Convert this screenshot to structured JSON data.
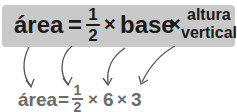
{
  "formula": {
    "area": "área",
    "equals": "=",
    "half_num": "1",
    "half_den": "2",
    "times": "×",
    "base": "base",
    "height_line1": "altura",
    "height_line2": "vertical"
  },
  "substituted": {
    "area": "área",
    "equals": "=",
    "half_num": "1",
    "half_den": "2",
    "times1": "×",
    "base_value": "6",
    "times2": "×",
    "height_value": "3"
  },
  "colors": {
    "box_bg": "#c9c9c9",
    "formula_text": "#1a1a1a",
    "substituted_text": "#6b6b6b",
    "arrow": "#555555"
  }
}
